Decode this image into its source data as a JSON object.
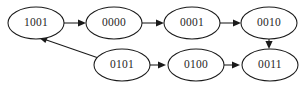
{
  "diagram": {
    "type": "directed-state-graph",
    "background_color": "#ffffff",
    "stroke_color": "#1a1a1a",
    "text_color": "#262626",
    "nodes": [
      {
        "id": "n1001",
        "label": "1001",
        "cx": 36,
        "cy": 23,
        "rx": 28,
        "ry": 16
      },
      {
        "id": "n0000",
        "label": "0000",
        "cx": 114,
        "cy": 23,
        "rx": 28,
        "ry": 16
      },
      {
        "id": "n0001",
        "label": "0001",
        "cx": 192,
        "cy": 23,
        "rx": 28,
        "ry": 16
      },
      {
        "id": "n0010",
        "label": "0010",
        "cx": 269,
        "cy": 23,
        "rx": 28,
        "ry": 16
      },
      {
        "id": "n0101",
        "label": "0101",
        "cx": 122,
        "cy": 65,
        "rx": 28,
        "ry": 16
      },
      {
        "id": "n0100",
        "label": "0100",
        "cx": 196,
        "cy": 65,
        "rx": 28,
        "ry": 16
      },
      {
        "id": "n0011",
        "label": "0011",
        "cx": 270,
        "cy": 65,
        "rx": 28,
        "ry": 16
      }
    ],
    "edges": [
      {
        "id": "e1",
        "from": "1001",
        "to": "0000",
        "kind": "horizontal"
      },
      {
        "id": "e2",
        "from": "0000",
        "to": "0001",
        "kind": "horizontal"
      },
      {
        "id": "e3",
        "from": "0001",
        "to": "0010",
        "kind": "horizontal"
      },
      {
        "id": "e4",
        "from": "0010",
        "to": "0011",
        "kind": "vertical"
      },
      {
        "id": "e5",
        "from": "0101",
        "to": "0100",
        "kind": "horizontal"
      },
      {
        "id": "e6",
        "from": "0100",
        "to": "0011",
        "kind": "horizontal"
      },
      {
        "id": "e7",
        "from": "0101",
        "to": "1001",
        "kind": "diagonal"
      }
    ]
  }
}
